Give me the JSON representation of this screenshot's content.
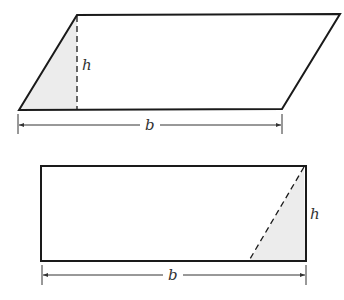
{
  "figure": {
    "colors": {
      "stroke": "#1a1a1a",
      "shade": "#ececec",
      "dim": "#333333"
    },
    "parallelogram": {
      "points": "19,110 77,15 340,14 282,109",
      "shade_points": "19,110 77,15 77,110",
      "height_label": "h",
      "base_label": "b"
    },
    "rectangle": {
      "height_label": "h",
      "base_label": "b"
    }
  }
}
